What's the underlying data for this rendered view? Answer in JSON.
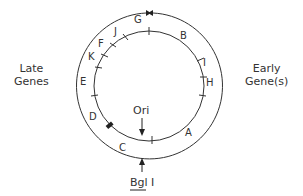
{
  "diagram": {
    "left_label": [
      "Late",
      "Genes"
    ],
    "right_label": [
      "Early",
      "Gene(s)"
    ],
    "origin_label": "Ori",
    "site_label": "Bgl I",
    "segments": {
      "A": "A",
      "B": "B",
      "C": "C",
      "D": "D",
      "E": "E",
      "F": "F",
      "G": "G",
      "H": "H",
      "I": "I",
      "J": "J",
      "K": "K"
    },
    "line_color": "#333333"
  }
}
